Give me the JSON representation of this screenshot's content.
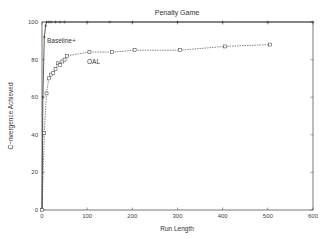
{
  "chart_data": {
    "type": "line",
    "title": "Penalty Game",
    "xlabel": "Run Length",
    "ylabel": "C~nvergence Achieved",
    "xlim": [
      0,
      600
    ],
    "ylim": [
      0,
      100
    ],
    "xticks": [
      0,
      100,
      200,
      300,
      400,
      500,
      600
    ],
    "yticks": [
      0,
      20,
      40,
      60,
      80,
      100
    ],
    "grid": false,
    "legend": "inline labels",
    "series": [
      {
        "name": "Baseline+",
        "style": "solid, plus markers",
        "x": [
          0,
          2,
          5,
          8,
          10,
          15,
          20,
          30,
          40,
          50,
          100,
          150,
          200,
          300,
          400,
          500,
          600
        ],
        "y": [
          0,
          60,
          92,
          98,
          100,
          100,
          100,
          100,
          100,
          100,
          100,
          100,
          100,
          100,
          100,
          100,
          100
        ]
      },
      {
        "name": "OAL",
        "style": "dashed, square markers",
        "x": [
          0,
          5,
          10,
          15,
          20,
          25,
          30,
          35,
          40,
          45,
          50,
          55,
          105,
          155,
          205,
          305,
          405,
          505
        ],
        "y": [
          0,
          41,
          62,
          70,
          72,
          73,
          75,
          78,
          77,
          79,
          80,
          82,
          84,
          84,
          85,
          85,
          87,
          88
        ]
      }
    ]
  }
}
